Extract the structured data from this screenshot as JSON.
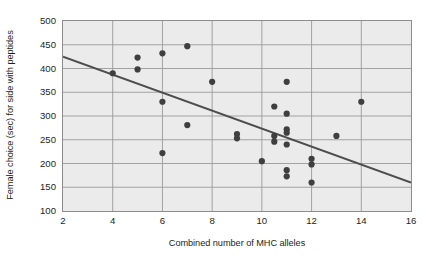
{
  "chart_data": {
    "type": "scatter",
    "title": "",
    "xlabel": "Combined number of MHC alleles",
    "ylabel": "Female choice (sec) for side with peptides",
    "xlim": [
      2,
      16
    ],
    "ylim": [
      100,
      500
    ],
    "xticks": [
      2,
      4,
      6,
      8,
      10,
      12,
      14,
      16
    ],
    "yticks": [
      100,
      150,
      200,
      250,
      300,
      350,
      400,
      450,
      500
    ],
    "grid": true,
    "legend": false,
    "point_color": "#3f3f3f",
    "line_color": "#4d4d4d",
    "plot_background": "#ebebeb",
    "points": [
      {
        "x": 4,
        "y": 390
      },
      {
        "x": 5,
        "y": 423
      },
      {
        "x": 5,
        "y": 398
      },
      {
        "x": 6,
        "y": 432
      },
      {
        "x": 6,
        "y": 330
      },
      {
        "x": 6,
        "y": 222
      },
      {
        "x": 7,
        "y": 447
      },
      {
        "x": 7,
        "y": 281
      },
      {
        "x": 8,
        "y": 372
      },
      {
        "x": 9,
        "y": 262
      },
      {
        "x": 9,
        "y": 253
      },
      {
        "x": 10,
        "y": 205
      },
      {
        "x": 10.5,
        "y": 320
      },
      {
        "x": 10.5,
        "y": 258
      },
      {
        "x": 10.5,
        "y": 246
      },
      {
        "x": 11,
        "y": 372
      },
      {
        "x": 11,
        "y": 305
      },
      {
        "x": 11,
        "y": 272
      },
      {
        "x": 11,
        "y": 265
      },
      {
        "x": 11,
        "y": 240
      },
      {
        "x": 11,
        "y": 186
      },
      {
        "x": 11,
        "y": 173
      },
      {
        "x": 12,
        "y": 210
      },
      {
        "x": 12,
        "y": 198
      },
      {
        "x": 12,
        "y": 160
      },
      {
        "x": 13,
        "y": 258
      },
      {
        "x": 14,
        "y": 330
      }
    ],
    "trendline": {
      "x1": 2,
      "y1": 425,
      "x2": 16,
      "y2": 160
    }
  }
}
